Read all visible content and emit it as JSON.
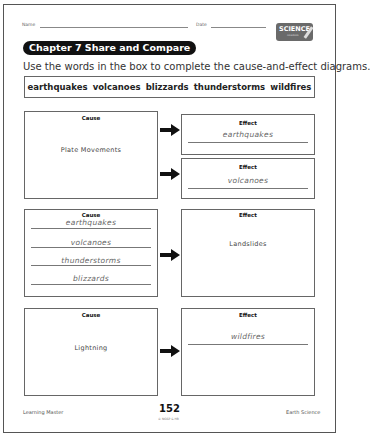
{
  "header": {
    "name_label": "Name",
    "date_label": "Date",
    "logo_text": "SCIENCE",
    "logo_subtext": "notebook",
    "chapter_pill": "Chapter 7  Share and Compare",
    "instructions": "Use the words in the box to complete the cause-and-effect diagrams."
  },
  "word_box": {
    "words": [
      "earthquakes",
      "volcanoes",
      "blizzards",
      "thunderstorms",
      "wildfires"
    ]
  },
  "diagrams": [
    {
      "cause_header": "Cause",
      "cause_text": "Plate Movements",
      "effects": [
        {
          "header": "Effect",
          "answer": "earthquakes"
        },
        {
          "header": "Effect",
          "answer": "volcanoes"
        }
      ]
    },
    {
      "cause_header": "Cause",
      "causes": [
        "earthquakes",
        "volcanoes",
        "thunderstorms",
        "blizzards"
      ],
      "effect_header": "Effect",
      "effect_text": "Landslides"
    },
    {
      "cause_header": "Cause",
      "cause_text": "Lightning",
      "effect_header": "Effect",
      "effect_answer": "wildfires"
    }
  ],
  "footer": {
    "left": "Learning Master",
    "page_number": "152",
    "copyright": "© NGSP & HB",
    "right": "Earth Science"
  }
}
